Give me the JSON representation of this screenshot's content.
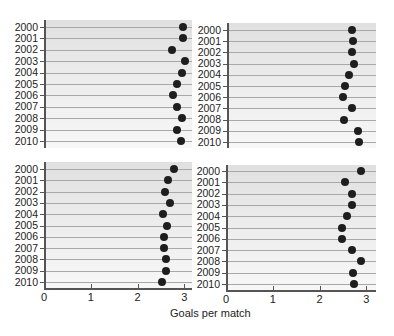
{
  "chart_data": [
    {
      "type": "scatter",
      "panel": "top-left",
      "categories": [
        "2000",
        "2001",
        "2002",
        "2003",
        "2004",
        "2005",
        "2006",
        "2007",
        "2008",
        "2009",
        "2010"
      ],
      "values": [
        2.98,
        2.98,
        2.74,
        3.02,
        2.95,
        2.85,
        2.76,
        2.85,
        2.95,
        2.85,
        2.93
      ],
      "xlim": [
        0,
        3.2
      ],
      "grid": true
    },
    {
      "type": "scatter",
      "panel": "top-right",
      "categories": [
        "2000",
        "2001",
        "2002",
        "2003",
        "2004",
        "2005",
        "2006",
        "2007",
        "2008",
        "2009",
        "2010"
      ],
      "values": [
        2.67,
        2.69,
        2.67,
        2.71,
        2.6,
        2.52,
        2.47,
        2.67,
        2.49,
        2.79,
        2.81
      ],
      "xlim": [
        0,
        3.2
      ],
      "grid": true
    },
    {
      "type": "scatter",
      "panel": "bottom-left",
      "categories": [
        "2000",
        "2001",
        "2002",
        "2003",
        "2004",
        "2005",
        "2006",
        "2007",
        "2008",
        "2009",
        "2010"
      ],
      "values": [
        2.78,
        2.66,
        2.59,
        2.7,
        2.55,
        2.63,
        2.57,
        2.57,
        2.61,
        2.61,
        2.53
      ],
      "xlim": [
        0,
        3.2
      ],
      "xticks": [
        "0",
        "1",
        "2",
        "3"
      ],
      "grid": true
    },
    {
      "type": "scatter",
      "panel": "bottom-right",
      "categories": [
        "2000",
        "2001",
        "2002",
        "2003",
        "2004",
        "2005",
        "2006",
        "2007",
        "2008",
        "2009",
        "2010"
      ],
      "values": [
        2.88,
        2.54,
        2.69,
        2.69,
        2.58,
        2.47,
        2.47,
        2.69,
        2.88,
        2.71,
        2.73
      ],
      "xlim": [
        0,
        3.2
      ],
      "xticks": [
        "0",
        "1",
        "2",
        "3"
      ],
      "grid": true
    }
  ],
  "xlabel": "Goals per match",
  "years": [
    "2000",
    "2001",
    "2002",
    "2003",
    "2004",
    "2005",
    "2006",
    "2007",
    "2008",
    "2009",
    "2010"
  ],
  "xticks": [
    "0",
    "1",
    "2",
    "3"
  ]
}
